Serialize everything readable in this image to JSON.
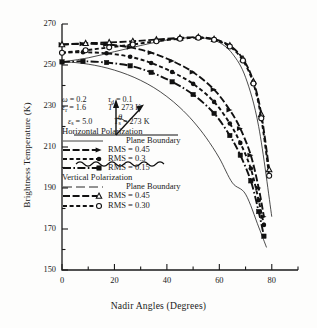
{
  "chart_data": {
    "type": "line",
    "title": "",
    "xlabel": "Nadir Angles (Degrees)",
    "ylabel": "Brightness Temperature (K)",
    "xlim": [
      0,
      90
    ],
    "ylim": [
      150,
      270
    ],
    "xticks": [
      0,
      20,
      40,
      60,
      80
    ],
    "yticks": [
      150,
      170,
      190,
      210,
      230,
      250,
      270
    ],
    "xminor_step": 10,
    "yminor_step": 10,
    "grid": false,
    "legend_position": "inside-left",
    "series": [
      {
        "name": "Horizontal Polarization — Plane Boundary",
        "polarization": "Horizontal",
        "rms": null,
        "style": "thin-solid",
        "marker": "none",
        "x": [
          0,
          5,
          10,
          15,
          20,
          25,
          30,
          35,
          40,
          45,
          50,
          55,
          60,
          65,
          70,
          75,
          78
        ],
        "y": [
          251.5,
          251.2,
          250.4,
          249.2,
          247.5,
          245.3,
          242.5,
          239.0,
          234.6,
          229.2,
          222.6,
          214.5,
          204.6,
          192.5,
          187.0,
          171.0,
          161.0
        ]
      },
      {
        "name": "Horizontal Polarization — RMS = 0.45",
        "polarization": "Horizontal",
        "rms": 0.45,
        "style": "dash-arrow",
        "marker": "arrow",
        "x": [
          0,
          8,
          17,
          26,
          34,
          42,
          50,
          58,
          64,
          68,
          72,
          75,
          77
        ],
        "y": [
          260.0,
          260.3,
          260.0,
          258.6,
          256.0,
          252.0,
          246.5,
          238.0,
          228.0,
          219.0,
          206.0,
          190.0,
          176.0
        ]
      },
      {
        "name": "Horizontal Polarization — RMS = 0.3",
        "polarization": "Horizontal",
        "rms": 0.3,
        "style": "dashed-dot",
        "marker": "circle",
        "x": [
          0,
          8,
          17,
          26,
          34,
          42,
          50,
          58,
          64,
          68,
          72,
          75,
          77
        ],
        "y": [
          256.0,
          256.2,
          255.7,
          254.0,
          251.0,
          246.6,
          240.8,
          232.0,
          221.5,
          212.0,
          199.5,
          184.0,
          172.0
        ]
      },
      {
        "name": "Horizontal Polarization — RMS = 0.15",
        "polarization": "Horizontal",
        "rms": 0.15,
        "style": "dashdot-square",
        "marker": "square",
        "x": [
          0,
          8,
          17,
          26,
          34,
          42,
          50,
          58,
          64,
          68,
          72,
          75,
          77
        ],
        "y": [
          251.5,
          251.8,
          251.2,
          249.6,
          246.4,
          241.8,
          235.6,
          226.4,
          215.6,
          206.0,
          193.5,
          178.5,
          166.5
        ]
      },
      {
        "name": "Vertical Polarization — Plane Boundary",
        "polarization": "Vertical",
        "rms": null,
        "style": "thin-solid",
        "marker": "none",
        "x": [
          0,
          10,
          20,
          30,
          40,
          45,
          50,
          55,
          60,
          65,
          70,
          75,
          80
        ],
        "y": [
          251.5,
          253.5,
          256.5,
          259.5,
          262.2,
          263.0,
          263.4,
          263.0,
          261.0,
          255.5,
          244.0,
          220.0,
          176.0
        ]
      },
      {
        "name": "Vertical Polarization — RMS = 0.45",
        "polarization": "Vertical",
        "rms": 0.45,
        "style": "dash-triangle",
        "marker": "triangle",
        "x": [
          0,
          9,
          18,
          27,
          36,
          45,
          52,
          58,
          64,
          69,
          73,
          76,
          79
        ],
        "y": [
          260.0,
          260.6,
          261.0,
          261.6,
          262.4,
          263.2,
          263.6,
          262.6,
          259.5,
          253.0,
          242.0,
          226.0,
          199.0
        ]
      },
      {
        "name": "Vertical Polarization — RMS = 0.30",
        "polarization": "Vertical",
        "rms": 0.3,
        "style": "dashed-opencircle",
        "marker": "open-circle",
        "x": [
          0,
          9,
          18,
          27,
          36,
          45,
          52,
          58,
          64,
          69,
          73,
          76,
          79
        ],
        "y": [
          256.0,
          257.2,
          258.6,
          260.0,
          261.6,
          262.8,
          263.3,
          262.3,
          259.0,
          252.2,
          241.0,
          224.0,
          196.0
        ]
      }
    ]
  },
  "inset": {
    "angle_symbol": "θ",
    "name": "nadir-angle-diagram"
  },
  "params": [
    {
      "left_symbol": "ω",
      "left_sub": "",
      "left_value": "= 0.2",
      "right_symbol": "τ",
      "right_sub": "d",
      "right_value": "=  0.1"
    },
    {
      "left_symbol": "ε",
      "left_sub": "r",
      "left_value": "= 1.6",
      "right_symbol": "T",
      "right_sub": "",
      "right_value": "= 273 K"
    },
    {
      "left_symbol": "ε",
      "left_sub": "s",
      "left_value": "= 5.0",
      "right_symbol": "T",
      "right_sub": "s",
      "right_value": "= 273 K"
    }
  ],
  "legend": {
    "groups": [
      {
        "heading": "Horizontal Polarization",
        "entries": [
          {
            "label": "Plane Boundary",
            "style": "thin-solid",
            "indent": true
          },
          {
            "label": "RMS = 0.45",
            "style": "dash-arrow",
            "indent": false
          },
          {
            "label": "RMS = 0.3",
            "style": "dashed-dot",
            "indent": false
          },
          {
            "label": "RMS = 0.15",
            "style": "dashdot-square",
            "indent": false
          }
        ]
      },
      {
        "heading": "Vertical Polarization",
        "entries": [
          {
            "label": "Plane Boundary",
            "style": "thin-dash",
            "indent": true
          },
          {
            "label": "RMS = 0.45",
            "style": "dash-triangle",
            "indent": false
          },
          {
            "label": "RMS = 0.30",
            "style": "dashed-opencircle",
            "indent": false
          }
        ]
      }
    ]
  },
  "colors": {
    "ink": "#1a1a1a",
    "background": "#fdfdfc"
  }
}
